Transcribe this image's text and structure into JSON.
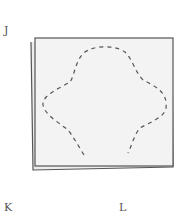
{
  "labels": {
    "top_left": "J",
    "bottom_left": "K",
    "bottom_right": "L"
  },
  "figure": {
    "paper_fill": "#f3f3f3",
    "outline_color": "#555555",
    "dash_color": "#555555"
  }
}
